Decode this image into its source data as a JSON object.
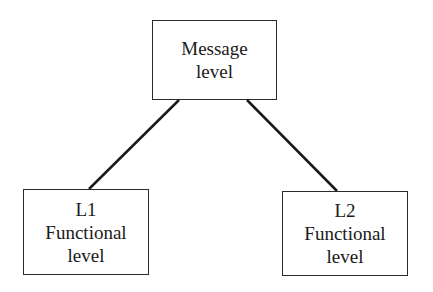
{
  "diagram": {
    "type": "tree",
    "nodes": [
      {
        "id": "message",
        "lines": [
          "Message",
          "level"
        ]
      },
      {
        "id": "l1",
        "lines": [
          "L1",
          "Functional",
          "level"
        ]
      },
      {
        "id": "l2",
        "lines": [
          "L2",
          "Functional",
          "level"
        ]
      }
    ],
    "edges": [
      {
        "from": "message",
        "to": "l1"
      },
      {
        "from": "message",
        "to": "l2"
      }
    ],
    "colors": {
      "line": "#1a1a1a",
      "border": "#2a2a2a",
      "background": "#ffffff"
    }
  }
}
